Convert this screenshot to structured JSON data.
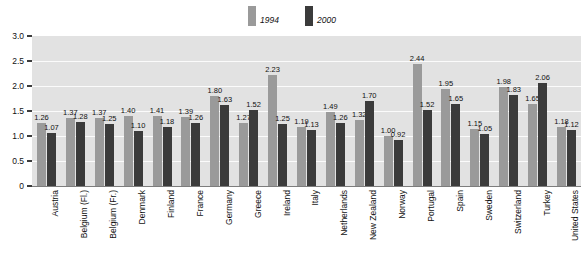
{
  "chart_data": {
    "type": "bar",
    "title": "",
    "xlabel": "",
    "ylabel": "",
    "ylim": [
      0,
      3.0
    ],
    "yticks": [
      "0",
      "0.5",
      "1.0",
      "1.5",
      "2.0",
      "2.5",
      "3.0"
    ],
    "ytick_values": [
      0,
      0.5,
      1.0,
      1.5,
      2.0,
      2.5,
      3.0
    ],
    "grid": true,
    "legend_position": "top-center",
    "categories": [
      "Austria",
      "Belgium (Fl.)",
      "Belgium (Fr.)",
      "Denmark",
      "Finland",
      "France",
      "Germany",
      "Greece",
      "Ireland",
      "Italy",
      "Netherlands",
      "New Zealand",
      "Norway",
      "Portugal",
      "Spain",
      "Sweden",
      "Switzerland",
      "Turkey",
      "United States"
    ],
    "series": [
      {
        "name": "1994",
        "color": "#9a9a9a",
        "values": [
          1.26,
          1.37,
          1.37,
          1.4,
          1.41,
          1.39,
          1.8,
          1.27,
          2.23,
          1.19,
          1.49,
          1.32,
          1.0,
          2.44,
          1.95,
          1.15,
          1.98,
          1.65,
          1.18
        ],
        "labels": [
          "1.26",
          "1.37",
          "1.37",
          "1.40",
          "1.41",
          "1.39",
          "1.80",
          "1.27",
          "2.23",
          "1.19",
          "1.49",
          "1.32",
          "1.00",
          "2.44",
          "1.95",
          "1.15",
          "1.98",
          "1.65",
          "1.18"
        ]
      },
      {
        "name": "2000",
        "color": "#3b3b3b",
        "values": [
          1.07,
          1.28,
          1.25,
          1.1,
          1.18,
          1.26,
          1.63,
          1.52,
          1.25,
          1.13,
          1.26,
          1.7,
          0.92,
          1.52,
          1.65,
          1.05,
          1.83,
          2.06,
          1.12
        ],
        "labels": [
          "1.07",
          "1.28",
          "1.25",
          "1.10",
          "1.18",
          "1.26",
          "1.63",
          "1.52",
          "1.25",
          "1.13",
          "1.26",
          "1.70",
          "0.92",
          "1.52",
          "1.65",
          "1.05",
          "1.83",
          "2.06",
          "1.12"
        ]
      }
    ]
  },
  "colors": {
    "series_1994": "#9a9a9a",
    "series_2000": "#3b3b3b",
    "plot_background": "#e2e2e2",
    "gridline": "#fbfbfb",
    "axis": "#3c3c3c",
    "text": "#111111"
  }
}
